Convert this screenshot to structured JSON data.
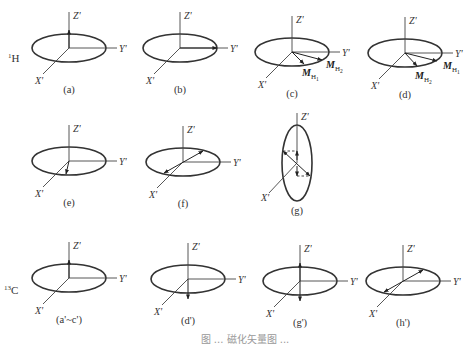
{
  "figure": {
    "nucleus_labels": [
      {
        "id": "h1",
        "text": "1",
        "base": "H",
        "x": 8,
        "y": 62
      },
      {
        "id": "c13",
        "text": "13",
        "base": "C",
        "x": 4,
        "y": 294
      }
    ],
    "axis_labels": {
      "z": "Z'",
      "y": "Y'",
      "x": "X'"
    },
    "caption": "图 ... 磁化矢量图 ...",
    "panels": [
      {
        "id": "a",
        "label": "(a)",
        "cx": 69,
        "cy": 48,
        "rx": 37,
        "ry": 14,
        "vertical": false,
        "vectors": [
          {
            "type": "z-up"
          }
        ]
      },
      {
        "id": "b",
        "label": "(b)",
        "cx": 180,
        "cy": 48,
        "rx": 37,
        "ry": 14,
        "vertical": false,
        "vectors": [
          {
            "type": "y"
          }
        ]
      },
      {
        "id": "c",
        "label": "(c)",
        "cx": 292,
        "cy": 52,
        "rx": 37,
        "ry": 14,
        "vertical": false,
        "vectors": [
          {
            "type": "mh",
            "first": "M",
            "sub1": "H",
            "sub1n": "1",
            "sub2n": "2"
          }
        ]
      },
      {
        "id": "d",
        "label": "(d)",
        "cx": 405,
        "cy": 53,
        "rx": 37,
        "ry": 14,
        "vertical": false,
        "vectors": [
          {
            "type": "mh-swapped"
          }
        ]
      },
      {
        "id": "e",
        "label": "(e)",
        "cx": 69,
        "cy": 161,
        "rx": 37,
        "ry": 14,
        "vertical": false,
        "vectors": [
          {
            "type": "x-short"
          }
        ]
      },
      {
        "id": "f",
        "label": "(f)",
        "cx": 183,
        "cy": 162,
        "rx": 37,
        "ry": 14,
        "vertical": false,
        "vectors": [
          {
            "type": "diag-both"
          }
        ]
      },
      {
        "id": "g",
        "label": "(g)",
        "cx": 297,
        "cy": 163,
        "rx": 15,
        "ry": 38,
        "vertical": true,
        "vectors": [
          {
            "type": "tilted-both"
          }
        ]
      },
      {
        "id": "ac",
        "label": "(a'~c')",
        "cx": 69,
        "cy": 278,
        "rx": 37,
        "ry": 14,
        "vertical": false,
        "vectors": [
          {
            "type": "z-up"
          }
        ]
      },
      {
        "id": "dp",
        "label": "(d')",
        "cx": 188,
        "cy": 279,
        "rx": 37,
        "ry": 14,
        "vertical": false,
        "vectors": [
          {
            "type": "z-down"
          }
        ]
      },
      {
        "id": "gp",
        "label": "(g')",
        "cx": 300,
        "cy": 281,
        "rx": 37,
        "ry": 14,
        "vertical": false,
        "vectors": [
          {
            "type": "z-both"
          }
        ]
      },
      {
        "id": "hp",
        "label": "(h')",
        "cx": 403,
        "cy": 281,
        "rx": 37,
        "ry": 14,
        "vertical": false,
        "vectors": [
          {
            "type": "diag-both"
          }
        ]
      }
    ],
    "vector_labels": {
      "c": [
        {
          "main": "M",
          "sub": "H",
          "subn": "1",
          "dx": -2,
          "dy": 24
        },
        {
          "main": "M",
          "sub": "H",
          "subn": "2",
          "dx": 22,
          "dy": 16
        }
      ],
      "d": [
        {
          "main": "M",
          "sub": "H",
          "subn": "2",
          "dx": -2,
          "dy": 26
        },
        {
          "main": "M",
          "sub": "H",
          "subn": "1",
          "dx": 26,
          "dy": 16
        }
      ]
    }
  }
}
